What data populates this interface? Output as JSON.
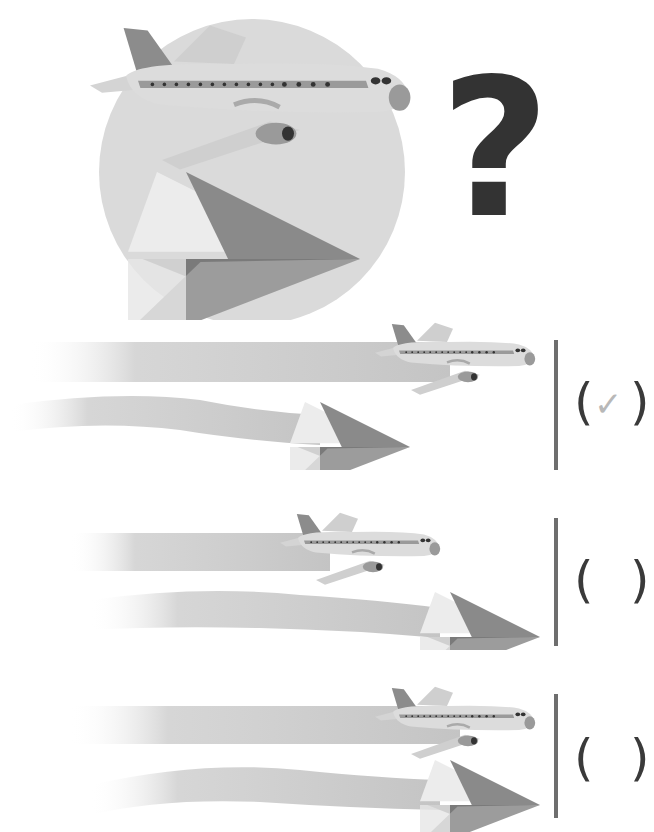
{
  "question": {
    "symbol": "?",
    "illustration": "airliner-and-paper-plane-in-circle"
  },
  "options": [
    {
      "id": "A",
      "description": "airliner ahead (top, straight trail), paper plane behind (bottom, wavy trail)",
      "bracket_open": "(",
      "mark": "✓",
      "bracket_close": ")",
      "selected": true
    },
    {
      "id": "B",
      "description": "paper plane ahead (bottom), airliner behind (top)",
      "bracket_open": "(",
      "mark": "",
      "bracket_close": ")",
      "selected": false
    },
    {
      "id": "C",
      "description": "airliner and paper plane even",
      "bracket_open": "(",
      "mark": "",
      "bracket_close": ")",
      "selected": false
    }
  ],
  "colors": {
    "circle": "#dadada",
    "trail": "#c9c9c9",
    "plane_body": "#d8d8d8",
    "plane_tail": "#8c8c8c",
    "paper_plane": "#8a8a8a",
    "question_mark": "#333333",
    "check": "#b8b8b8",
    "divider": "#6e6e6e"
  }
}
